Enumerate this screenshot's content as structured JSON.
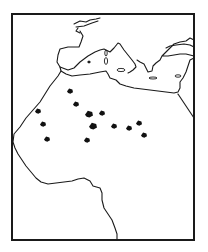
{
  "map": {
    "region": "North Africa and Mediterranean",
    "colors": {
      "background": "#ffffff",
      "line": "#1a1a1a",
      "marker": "#111111"
    },
    "frame": {
      "x": 12,
      "y": 14,
      "width": 182,
      "height": 226
    },
    "markers": [
      {
        "x": 70,
        "y": 91,
        "size": 6
      },
      {
        "x": 76,
        "y": 104,
        "size": 6
      },
      {
        "x": 38,
        "y": 111,
        "size": 6
      },
      {
        "x": 89,
        "y": 114,
        "size": 8
      },
      {
        "x": 102,
        "y": 113,
        "size": 6
      },
      {
        "x": 43,
        "y": 124,
        "size": 6
      },
      {
        "x": 93,
        "y": 126,
        "size": 8
      },
      {
        "x": 114,
        "y": 126,
        "size": 6
      },
      {
        "x": 129,
        "y": 128,
        "size": 6
      },
      {
        "x": 139,
        "y": 123,
        "size": 6
      },
      {
        "x": 47,
        "y": 139,
        "size": 6
      },
      {
        "x": 87,
        "y": 140,
        "size": 6
      },
      {
        "x": 144,
        "y": 135,
        "size": 6
      }
    ]
  }
}
